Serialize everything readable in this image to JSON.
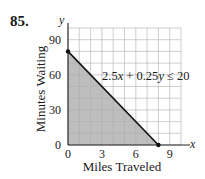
{
  "problem_number": "85.",
  "chart_data": {
    "type": "area",
    "title": "",
    "xlabel": "Miles Traveled",
    "ylabel": "Minutes Waiting",
    "x_axis_var": "x",
    "y_axis_var": "y",
    "xlim": [
      0,
      10
    ],
    "ylim": [
      0,
      100
    ],
    "x_ticks": [
      0,
      3,
      6,
      9
    ],
    "y_ticks": [
      0,
      30,
      60,
      90
    ],
    "x_tick_labels": [
      "0",
      "3",
      "6",
      "9"
    ],
    "y_tick_labels": [
      "0",
      "30",
      "60",
      "90"
    ],
    "grid": true,
    "grid_x_step": 1,
    "grid_y_step": 10,
    "series": [
      {
        "name": "2.5x + 0.25y ≤ 20",
        "boundary_line": {
          "x": [
            0,
            8
          ],
          "y": [
            80,
            0
          ]
        },
        "shaded_region_vertices": [
          [
            0,
            0
          ],
          [
            0,
            80
          ],
          [
            8,
            0
          ]
        ],
        "endpoints": [
          [
            0,
            80
          ],
          [
            8,
            0
          ]
        ]
      }
    ],
    "annotations": [
      {
        "text": "2.5x + 0.25y ≤ 20",
        "x": 5.2,
        "y": 62
      }
    ],
    "colors": {
      "shade": "#b3b3b3",
      "line": "#111111",
      "grid": "#cfcfcf",
      "axis": "#222222"
    }
  },
  "annotation": {
    "prefix": "2.5",
    "x": "x",
    "mid": " + 0.25",
    "y": "y",
    "suffix": " ≤ 20"
  }
}
